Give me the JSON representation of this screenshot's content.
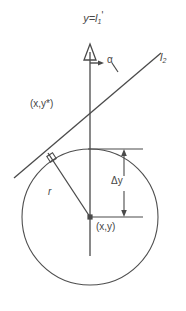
{
  "figure": {
    "title": {
      "full_text": "y=l1'",
      "lead": "y=l",
      "subscript": "1",
      "prime": "'"
    },
    "labels": {
      "angle_alpha": "α",
      "line_l2": {
        "full_text": "l2",
        "base": "l",
        "subscript": "2"
      },
      "point_on_line": "(x,y*)",
      "delta_y": "Δy",
      "radius": "r",
      "center_point": "(x,y)"
    },
    "colors": {
      "background": "#ffffff",
      "stroke": "#4a4a4a",
      "text": "#454545",
      "circle_stroke": "#4f4f4f"
    },
    "geometry": {
      "circle": {
        "cx": 90,
        "cy": 217,
        "r": 68
      },
      "vertical_axis": {
        "x": 90,
        "y_top": 45,
        "y_bottom": 256
      },
      "tangent_line": {
        "x1": 14,
        "y1": 178,
        "x2": 161,
        "y2": 53
      },
      "tangency_point": {
        "x": 47,
        "y": 152
      },
      "intersection_point": {
        "x": 90,
        "y": 117
      },
      "delta_y_span": {
        "y_top": 149,
        "y_bottom": 217
      }
    }
  }
}
